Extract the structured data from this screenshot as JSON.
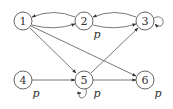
{
  "diagram": {
    "type": "directed-graph",
    "nodes": [
      {
        "id": "1",
        "label": "1",
        "x": 23,
        "y": 21,
        "annotation": ""
      },
      {
        "id": "2",
        "label": "2",
        "x": 84,
        "y": 21,
        "annotation": "p"
      },
      {
        "id": "3",
        "label": "3",
        "x": 145,
        "y": 21,
        "annotation": ""
      },
      {
        "id": "4",
        "label": "4",
        "x": 23,
        "y": 80,
        "annotation": "p"
      },
      {
        "id": "5",
        "label": "5",
        "x": 84,
        "y": 80,
        "annotation": "p"
      },
      {
        "id": "6",
        "label": "6",
        "x": 145,
        "y": 80,
        "annotation": "p"
      }
    ],
    "edges": [
      {
        "from": "2",
        "to": "1"
      },
      {
        "from": "1",
        "to": "2"
      },
      {
        "from": "3",
        "to": "2"
      },
      {
        "from": "2",
        "to": "3"
      },
      {
        "from": "3",
        "to": "3"
      },
      {
        "from": "1",
        "to": "5"
      },
      {
        "from": "1",
        "to": "6"
      },
      {
        "from": "5",
        "to": "3"
      },
      {
        "from": "4",
        "to": "5"
      },
      {
        "from": "5",
        "to": "6"
      },
      {
        "from": "5",
        "to": "5"
      }
    ],
    "colors": {
      "stroke": "#555555",
      "text": "#333333",
      "background": "#ffffff"
    }
  }
}
